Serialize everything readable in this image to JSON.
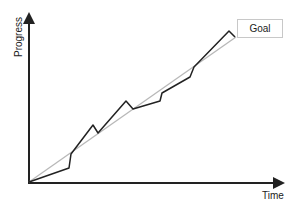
{
  "chart_data": {
    "type": "line",
    "title": "",
    "xlabel": "Time",
    "ylabel": "Progress",
    "grid": false,
    "legend": null,
    "annotations": [
      "Goal"
    ],
    "series": [
      {
        "name": "Goal (ideal trajectory)",
        "color": "#b8b8b8",
        "points_px": [
          [
            29,
            182
          ],
          [
            236,
            37
          ]
        ]
      },
      {
        "name": "Actual progress",
        "color": "#222222",
        "points_px": [
          [
            29,
            182
          ],
          [
            69,
            168
          ],
          [
            71,
            154
          ],
          [
            93,
            125
          ],
          [
            98,
            133
          ],
          [
            126,
            101
          ],
          [
            133,
            109
          ],
          [
            160,
            101
          ],
          [
            162,
            93
          ],
          [
            190,
            77
          ],
          [
            194,
            67
          ],
          [
            229,
            31
          ],
          [
            235,
            37
          ]
        ]
      }
    ]
  },
  "labels": {
    "y_axis": "Progress",
    "x_axis": "Time",
    "goal": "Goal"
  },
  "colors": {
    "axis": "#222222",
    "actual_line": "#222222",
    "goal_line": "#b8b8b8",
    "goal_box_border": "#c8c8c8"
  }
}
